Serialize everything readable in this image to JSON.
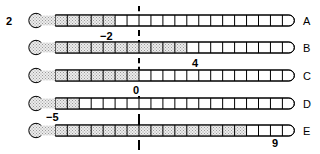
{
  "figure": {
    "question_number": "2",
    "type": "thermometer-scale-diagram",
    "zero_marker_label": "0",
    "dashed_line_label": "zero-reference"
  },
  "chart_data": {
    "type": "bar",
    "title": "",
    "subtitle": "",
    "xlabel": "",
    "ylabel": "",
    "orientation": "horizontal",
    "categories": [
      "A",
      "B",
      "C",
      "D",
      "E"
    ],
    "values": [
      -2,
      4,
      0,
      -5,
      9
    ],
    "value_labels": [
      "−2",
      "4",
      "0",
      "−5",
      "9"
    ],
    "xlim": [
      -7,
      13
    ],
    "grid": true,
    "tick_step": 1,
    "legend": "none",
    "annotations": [
      {
        "text": "0",
        "x": 0,
        "note": "dashed vertical zero reference line"
      }
    ]
  },
  "rows": [
    {
      "letter": "A",
      "value": -2,
      "label": "−2",
      "label_x": 100,
      "label_y": 30,
      "fill_to": -2
    },
    {
      "letter": "B",
      "value": 4,
      "label": "4",
      "label_x": 192,
      "label_y": 57,
      "fill_to": 4
    },
    {
      "letter": "C",
      "value": 0,
      "label": "0",
      "label_x": 133,
      "label_y": 84,
      "fill_to": 0
    },
    {
      "letter": "D",
      "value": -5,
      "label": "−5",
      "label_x": 46,
      "label_y": 112,
      "fill_to": -5
    },
    {
      "letter": "E",
      "value": 9,
      "label": "9",
      "label_x": 272,
      "label_y": 138,
      "fill_to": 9
    }
  ],
  "colors": {
    "ink": "#000000",
    "fill": "#d9d9d9",
    "tube": "#ffffff",
    "background": "#ffffff"
  }
}
